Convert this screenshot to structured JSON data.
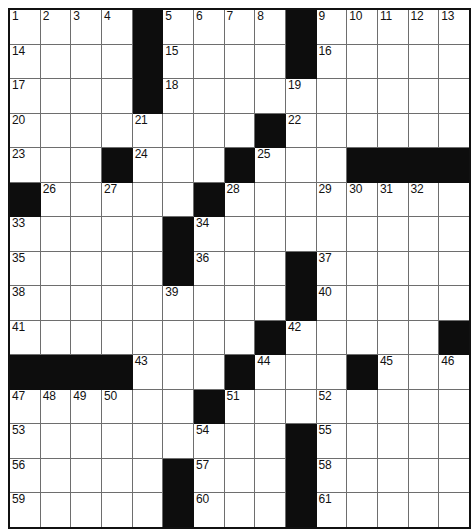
{
  "puzzle": {
    "title": "Crossword Grid",
    "type": "crossword-grid",
    "columns": 13,
    "rows": 14,
    "cell_size_px": 33.8,
    "colors": {
      "block": "#0d0d0d",
      "open": "#ffffff",
      "grid_line": "#6e6e6e",
      "border": "#111111",
      "number_text": "#111111"
    },
    "numbers_visible": [
      1,
      2,
      3,
      4,
      5,
      6,
      7,
      8,
      9,
      10,
      11,
      12,
      13,
      14,
      15,
      16,
      17,
      18,
      19,
      20,
      21,
      22,
      23,
      24,
      25,
      26,
      27,
      28,
      29,
      30,
      31,
      32,
      33,
      34,
      35,
      36,
      37,
      38,
      39,
      40,
      41,
      42,
      43,
      44,
      45,
      46,
      47,
      48,
      49,
      50,
      51,
      52,
      53,
      54,
      55,
      56,
      57,
      58,
      59,
      60,
      61
    ],
    "grid": [
      [
        {
          "block": false,
          "num": "1"
        },
        {
          "block": false,
          "num": "2"
        },
        {
          "block": false,
          "num": "3"
        },
        {
          "block": false,
          "num": "4"
        },
        {
          "block": true,
          "num": ""
        },
        {
          "block": false,
          "num": "5"
        },
        {
          "block": false,
          "num": "6"
        },
        {
          "block": false,
          "num": "7"
        },
        {
          "block": false,
          "num": "8"
        },
        {
          "block": true,
          "num": ""
        },
        {
          "block": false,
          "num": "9"
        },
        {
          "block": false,
          "num": "10"
        },
        {
          "block": false,
          "num": "11"
        },
        {
          "block": false,
          "num": "12"
        },
        {
          "block": false,
          "num": "13"
        }
      ],
      [
        {
          "block": false,
          "num": "14"
        },
        {
          "block": false,
          "num": ""
        },
        {
          "block": false,
          "num": ""
        },
        {
          "block": false,
          "num": ""
        },
        {
          "block": true,
          "num": ""
        },
        {
          "block": false,
          "num": "15"
        },
        {
          "block": false,
          "num": ""
        },
        {
          "block": false,
          "num": ""
        },
        {
          "block": false,
          "num": ""
        },
        {
          "block": true,
          "num": ""
        },
        {
          "block": false,
          "num": "16"
        },
        {
          "block": false,
          "num": ""
        },
        {
          "block": false,
          "num": ""
        },
        {
          "block": false,
          "num": ""
        },
        {
          "block": false,
          "num": ""
        }
      ],
      [
        {
          "block": false,
          "num": "17"
        },
        {
          "block": false,
          "num": ""
        },
        {
          "block": false,
          "num": ""
        },
        {
          "block": false,
          "num": ""
        },
        {
          "block": true,
          "num": ""
        },
        {
          "block": false,
          "num": "18"
        },
        {
          "block": false,
          "num": ""
        },
        {
          "block": false,
          "num": ""
        },
        {
          "block": false,
          "num": ""
        },
        {
          "block": false,
          "num": "19"
        },
        {
          "block": false,
          "num": ""
        },
        {
          "block": false,
          "num": ""
        },
        {
          "block": false,
          "num": ""
        },
        {
          "block": false,
          "num": ""
        },
        {
          "block": false,
          "num": ""
        }
      ],
      [
        {
          "block": false,
          "num": "20"
        },
        {
          "block": false,
          "num": ""
        },
        {
          "block": false,
          "num": ""
        },
        {
          "block": false,
          "num": ""
        },
        {
          "block": false,
          "num": "21"
        },
        {
          "block": false,
          "num": ""
        },
        {
          "block": false,
          "num": ""
        },
        {
          "block": false,
          "num": ""
        },
        {
          "block": true,
          "num": ""
        },
        {
          "block": false,
          "num": "22"
        },
        {
          "block": false,
          "num": ""
        },
        {
          "block": false,
          "num": ""
        },
        {
          "block": false,
          "num": ""
        },
        {
          "block": false,
          "num": ""
        },
        {
          "block": false,
          "num": ""
        }
      ],
      [
        {
          "block": false,
          "num": "23"
        },
        {
          "block": false,
          "num": ""
        },
        {
          "block": false,
          "num": ""
        },
        {
          "block": true,
          "num": ""
        },
        {
          "block": false,
          "num": "24"
        },
        {
          "block": false,
          "num": ""
        },
        {
          "block": false,
          "num": ""
        },
        {
          "block": true,
          "num": ""
        },
        {
          "block": false,
          "num": "25"
        },
        {
          "block": false,
          "num": ""
        },
        {
          "block": false,
          "num": ""
        },
        {
          "block": true,
          "num": ""
        },
        {
          "block": true,
          "num": ""
        },
        {
          "block": true,
          "num": ""
        },
        {
          "block": true,
          "num": ""
        }
      ],
      [
        {
          "block": true,
          "num": ""
        },
        {
          "block": false,
          "num": "26"
        },
        {
          "block": false,
          "num": ""
        },
        {
          "block": false,
          "num": "27"
        },
        {
          "block": false,
          "num": ""
        },
        {
          "block": false,
          "num": ""
        },
        {
          "block": true,
          "num": ""
        },
        {
          "block": false,
          "num": "28"
        },
        {
          "block": false,
          "num": ""
        },
        {
          "block": false,
          "num": ""
        },
        {
          "block": false,
          "num": "29"
        },
        {
          "block": false,
          "num": "30"
        },
        {
          "block": false,
          "num": "31"
        },
        {
          "block": false,
          "num": "32"
        },
        {
          "block": false,
          "num": ""
        }
      ],
      [
        {
          "block": false,
          "num": "33"
        },
        {
          "block": false,
          "num": ""
        },
        {
          "block": false,
          "num": ""
        },
        {
          "block": false,
          "num": ""
        },
        {
          "block": false,
          "num": ""
        },
        {
          "block": true,
          "num": ""
        },
        {
          "block": false,
          "num": "34"
        },
        {
          "block": false,
          "num": ""
        },
        {
          "block": false,
          "num": ""
        },
        {
          "block": false,
          "num": ""
        },
        {
          "block": false,
          "num": ""
        },
        {
          "block": false,
          "num": ""
        },
        {
          "block": false,
          "num": ""
        },
        {
          "block": false,
          "num": ""
        },
        {
          "block": false,
          "num": ""
        }
      ],
      [
        {
          "block": false,
          "num": "35"
        },
        {
          "block": false,
          "num": ""
        },
        {
          "block": false,
          "num": ""
        },
        {
          "block": false,
          "num": ""
        },
        {
          "block": false,
          "num": ""
        },
        {
          "block": true,
          "num": ""
        },
        {
          "block": false,
          "num": "36"
        },
        {
          "block": false,
          "num": ""
        },
        {
          "block": false,
          "num": ""
        },
        {
          "block": true,
          "num": ""
        },
        {
          "block": false,
          "num": "37"
        },
        {
          "block": false,
          "num": ""
        },
        {
          "block": false,
          "num": ""
        },
        {
          "block": false,
          "num": ""
        },
        {
          "block": false,
          "num": ""
        }
      ],
      [
        {
          "block": false,
          "num": "38"
        },
        {
          "block": false,
          "num": ""
        },
        {
          "block": false,
          "num": ""
        },
        {
          "block": false,
          "num": ""
        },
        {
          "block": false,
          "num": ""
        },
        {
          "block": false,
          "num": "39"
        },
        {
          "block": false,
          "num": ""
        },
        {
          "block": false,
          "num": ""
        },
        {
          "block": false,
          "num": ""
        },
        {
          "block": true,
          "num": ""
        },
        {
          "block": false,
          "num": "40"
        },
        {
          "block": false,
          "num": ""
        },
        {
          "block": false,
          "num": ""
        },
        {
          "block": false,
          "num": ""
        },
        {
          "block": false,
          "num": ""
        }
      ],
      [
        {
          "block": false,
          "num": "41"
        },
        {
          "block": false,
          "num": ""
        },
        {
          "block": false,
          "num": ""
        },
        {
          "block": false,
          "num": ""
        },
        {
          "block": false,
          "num": ""
        },
        {
          "block": false,
          "num": ""
        },
        {
          "block": false,
          "num": ""
        },
        {
          "block": false,
          "num": ""
        },
        {
          "block": true,
          "num": ""
        },
        {
          "block": false,
          "num": "42"
        },
        {
          "block": false,
          "num": ""
        },
        {
          "block": false,
          "num": ""
        },
        {
          "block": false,
          "num": ""
        },
        {
          "block": false,
          "num": ""
        },
        {
          "block": true,
          "num": ""
        }
      ],
      [
        {
          "block": true,
          "num": ""
        },
        {
          "block": true,
          "num": ""
        },
        {
          "block": true,
          "num": ""
        },
        {
          "block": true,
          "num": ""
        },
        {
          "block": false,
          "num": "43"
        },
        {
          "block": false,
          "num": ""
        },
        {
          "block": false,
          "num": ""
        },
        {
          "block": true,
          "num": ""
        },
        {
          "block": false,
          "num": "44"
        },
        {
          "block": false,
          "num": ""
        },
        {
          "block": false,
          "num": ""
        },
        {
          "block": true,
          "num": ""
        },
        {
          "block": false,
          "num": "45"
        },
        {
          "block": false,
          "num": ""
        },
        {
          "block": false,
          "num": "46"
        }
      ],
      [
        {
          "block": false,
          "num": "47"
        },
        {
          "block": false,
          "num": "48"
        },
        {
          "block": false,
          "num": "49"
        },
        {
          "block": false,
          "num": "50"
        },
        {
          "block": false,
          "num": ""
        },
        {
          "block": false,
          "num": ""
        },
        {
          "block": true,
          "num": ""
        },
        {
          "block": false,
          "num": "51"
        },
        {
          "block": false,
          "num": ""
        },
        {
          "block": false,
          "num": ""
        },
        {
          "block": false,
          "num": "52"
        },
        {
          "block": false,
          "num": ""
        },
        {
          "block": false,
          "num": ""
        },
        {
          "block": false,
          "num": ""
        },
        {
          "block": false,
          "num": ""
        }
      ],
      [
        {
          "block": false,
          "num": "53"
        },
        {
          "block": false,
          "num": ""
        },
        {
          "block": false,
          "num": ""
        },
        {
          "block": false,
          "num": ""
        },
        {
          "block": false,
          "num": ""
        },
        {
          "block": false,
          "num": ""
        },
        {
          "block": false,
          "num": "54"
        },
        {
          "block": false,
          "num": ""
        },
        {
          "block": false,
          "num": ""
        },
        {
          "block": true,
          "num": ""
        },
        {
          "block": false,
          "num": "55"
        },
        {
          "block": false,
          "num": ""
        },
        {
          "block": false,
          "num": ""
        },
        {
          "block": false,
          "num": ""
        },
        {
          "block": false,
          "num": ""
        }
      ],
      [
        {
          "block": false,
          "num": "56"
        },
        {
          "block": false,
          "num": ""
        },
        {
          "block": false,
          "num": ""
        },
        {
          "block": false,
          "num": ""
        },
        {
          "block": false,
          "num": ""
        },
        {
          "block": true,
          "num": ""
        },
        {
          "block": false,
          "num": "57"
        },
        {
          "block": false,
          "num": ""
        },
        {
          "block": false,
          "num": ""
        },
        {
          "block": true,
          "num": ""
        },
        {
          "block": false,
          "num": "58"
        },
        {
          "block": false,
          "num": ""
        },
        {
          "block": false,
          "num": ""
        },
        {
          "block": false,
          "num": ""
        },
        {
          "block": false,
          "num": ""
        }
      ],
      [
        {
          "block": false,
          "num": "59"
        },
        {
          "block": false,
          "num": ""
        },
        {
          "block": false,
          "num": ""
        },
        {
          "block": false,
          "num": ""
        },
        {
          "block": false,
          "num": ""
        },
        {
          "block": true,
          "num": ""
        },
        {
          "block": false,
          "num": "60"
        },
        {
          "block": false,
          "num": ""
        },
        {
          "block": false,
          "num": ""
        },
        {
          "block": true,
          "num": ""
        },
        {
          "block": false,
          "num": "61"
        },
        {
          "block": false,
          "num": ""
        },
        {
          "block": false,
          "num": ""
        },
        {
          "block": false,
          "num": ""
        },
        {
          "block": false,
          "num": ""
        }
      ]
    ]
  }
}
